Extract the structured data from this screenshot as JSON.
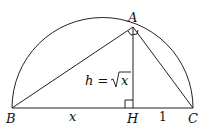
{
  "diagram": {
    "points": {
      "A": {
        "label": "A",
        "x": 133,
        "y": 27
      },
      "B": {
        "label": "B",
        "x": 12,
        "y": 108
      },
      "C": {
        "label": "C",
        "x": 193,
        "y": 108
      },
      "H": {
        "label": "H",
        "x": 133,
        "y": 108
      }
    },
    "labels": {
      "A": "A",
      "B": "B",
      "C": "C",
      "H": "H",
      "BH": "x",
      "HC": "1",
      "altitude_h": "h = ",
      "altitude_x": "x"
    },
    "semicircle": {
      "cx": 102.5,
      "cy": 108,
      "r": 90.5
    },
    "right_angles": [
      "A",
      "H"
    ],
    "colors": {
      "stroke": "#222222",
      "background": "#ffffff"
    }
  }
}
